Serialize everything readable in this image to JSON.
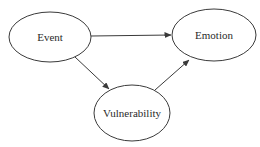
{
  "diagram": {
    "type": "directed-graph",
    "nodes": [
      {
        "id": "event",
        "label": "Event",
        "shape": "ellipse",
        "cx": 50,
        "cy": 37,
        "rx": 41,
        "ry": 25
      },
      {
        "id": "emotion",
        "label": "Emotion",
        "shape": "ellipse",
        "cx": 214,
        "cy": 35,
        "rx": 42,
        "ry": 26
      },
      {
        "id": "vulnerability",
        "label": "Vulnerability",
        "shape": "ellipse",
        "cx": 132,
        "cy": 113,
        "rx": 38,
        "ry": 28
      }
    ],
    "edges": [
      {
        "from": "event",
        "to": "emotion"
      },
      {
        "from": "event",
        "to": "vulnerability"
      },
      {
        "from": "vulnerability",
        "to": "emotion"
      }
    ],
    "colors": {
      "stroke": "#3a3a3a",
      "text": "#2a2a2a",
      "background": "#ffffff"
    }
  }
}
